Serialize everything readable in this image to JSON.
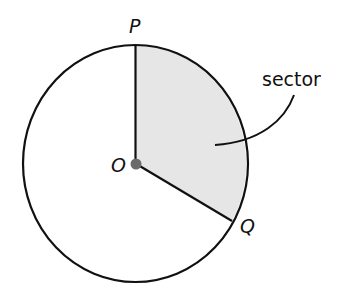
{
  "diagram": {
    "colors": {
      "stroke": "#111111",
      "sector_fill": "#e6e6e6",
      "center_dot": "#6b6b6b",
      "background": "#ffffff"
    },
    "circle": {
      "center": {
        "x": 135.5,
        "y": 163.5
      },
      "rx": 112.5,
      "ry": 118.5
    },
    "points": {
      "center": {
        "label": "O",
        "x": 135.5,
        "y": 163.5
      },
      "p": {
        "label": "P",
        "x": 135.5,
        "y": 45
      },
      "q": {
        "label": "Q",
        "x": 232,
        "y": 221
      }
    },
    "annotation": {
      "text": "sector"
    }
  }
}
